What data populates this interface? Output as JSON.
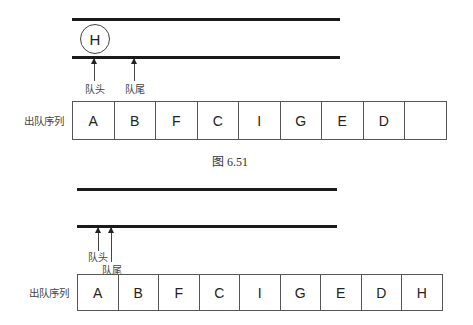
{
  "figure_top": {
    "queue_element": "H",
    "head_label": "队头",
    "tail_label": "队尾",
    "row_label": "出队序列",
    "dequeue_sequence": [
      "A",
      "B",
      "F",
      "C",
      "I",
      "G",
      "E",
      "D",
      ""
    ],
    "caption": "图 6.51"
  },
  "figure_bottom": {
    "head_label": "队头",
    "tail_label": "队尾",
    "row_label": "出队序列",
    "dequeue_sequence": [
      "A",
      "B",
      "F",
      "C",
      "I",
      "G",
      "E",
      "D",
      "H"
    ]
  }
}
